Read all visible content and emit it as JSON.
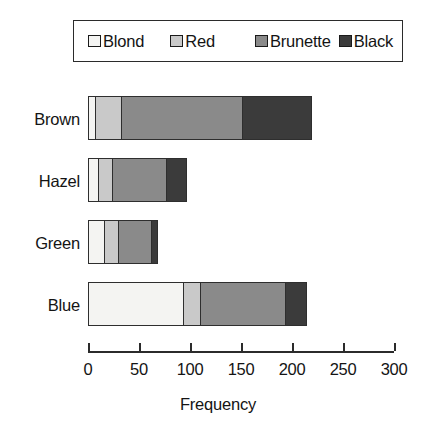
{
  "chart_data": {
    "type": "bar",
    "orientation": "horizontal",
    "stacked": true,
    "title": "",
    "xlabel": "Frequency",
    "ylabel": "",
    "categories": [
      "Brown",
      "Hazel",
      "Green",
      "Blue"
    ],
    "series": [
      {
        "name": "Blond",
        "color": "#f4f4f2",
        "values": [
          7,
          10,
          16,
          94
        ]
      },
      {
        "name": "Red",
        "color": "#c9c9c9",
        "values": [
          26,
          14,
          14,
          17
        ]
      },
      {
        "name": "Brunette",
        "color": "#8a8a8a",
        "values": [
          119,
          54,
          34,
          84
        ]
      },
      {
        "name": "Black",
        "color": "#3b3b3b",
        "values": [
          68,
          19,
          5,
          20
        ]
      }
    ],
    "totals": [
      220,
      97,
      69,
      215
    ],
    "xticks": [
      0,
      50,
      100,
      150,
      200,
      250,
      300
    ],
    "xlim": [
      0,
      300
    ],
    "grid": false,
    "legend_position": "top",
    "legend_entries": [
      "Blond",
      "Red",
      "Brunette",
      "Black"
    ]
  },
  "axis": {
    "title": "Frequency",
    "tick_labels": [
      "0",
      "50",
      "100",
      "150",
      "200",
      "250",
      "300"
    ]
  }
}
